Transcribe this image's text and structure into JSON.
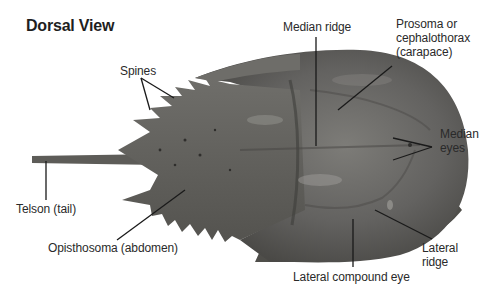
{
  "title": "Dorsal View",
  "colors": {
    "body_dark": "#4a4a47",
    "body_mid": "#6b6a66",
    "body_light": "#8a8985",
    "leader_line": "#1a1a1a",
    "label_text": "#2a2a2a"
  },
  "labels": {
    "spines": "Spines",
    "median_ridge": "Median ridge",
    "prosoma_line1": "Prosoma or",
    "prosoma_line2": "cephalothorax",
    "prosoma_line3": "(carapace)",
    "median_eyes_line1": "Median",
    "median_eyes_line2": "eyes",
    "telson": "Telson (tail)",
    "opisthosoma": "Opisthosoma (abdomen)",
    "lateral_ridge_line1": "Lateral",
    "lateral_ridge_line2": "ridge",
    "lateral_compound_eye": "Lateral compound eye"
  }
}
